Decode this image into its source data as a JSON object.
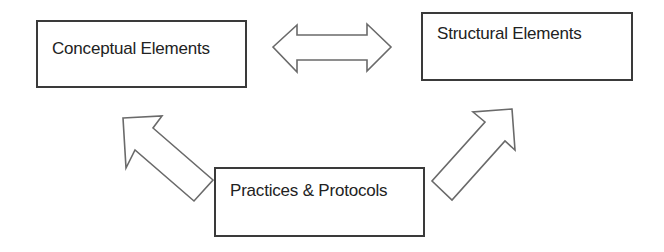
{
  "diagram": {
    "type": "concept-relationship",
    "nodes": [
      {
        "id": "conceptual",
        "label": "Conceptual Elements"
      },
      {
        "id": "structural",
        "label": "Structural Elements"
      },
      {
        "id": "practices",
        "label": "Practices & Protocols"
      }
    ],
    "edges": [
      {
        "from": "conceptual",
        "to": "structural",
        "style": "double-headed block arrow"
      },
      {
        "from": "practices",
        "to": "conceptual",
        "style": "block arrow"
      },
      {
        "from": "practices",
        "to": "structural",
        "style": "block arrow"
      }
    ],
    "colors": {
      "background": "#ffffff",
      "box_border": "#3a3a3a",
      "arrow_outline": "#6a6a6a",
      "text": "#222222"
    }
  }
}
